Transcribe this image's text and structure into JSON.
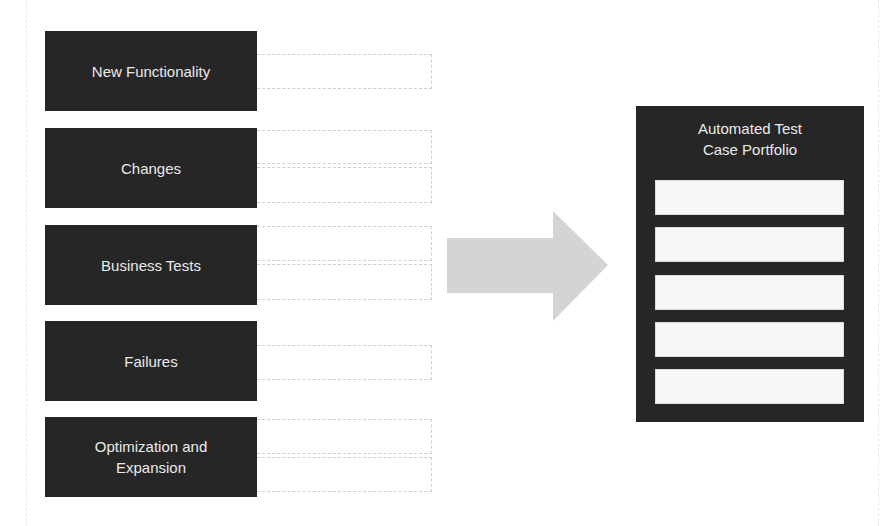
{
  "diagram": {
    "sources": [
      {
        "label": "New Functionality",
        "slots": 1
      },
      {
        "label": "Changes",
        "slots": 2
      },
      {
        "label": "Business Tests",
        "slots": 2
      },
      {
        "label": "Failures",
        "slots": 1
      },
      {
        "label": "Optimization and\nExpansion",
        "slots": 2
      }
    ],
    "arrow": {
      "direction": "right",
      "color": "#d4d4d4"
    },
    "target": {
      "title": "Automated Test\nCase Portfolio",
      "slot_count": 5
    },
    "colors": {
      "box_fill": "#262626",
      "box_text": "#eaeaea",
      "slot_fill": "#f7f7f7",
      "outline": "#cfcfcf",
      "background": "#ffffff"
    }
  }
}
